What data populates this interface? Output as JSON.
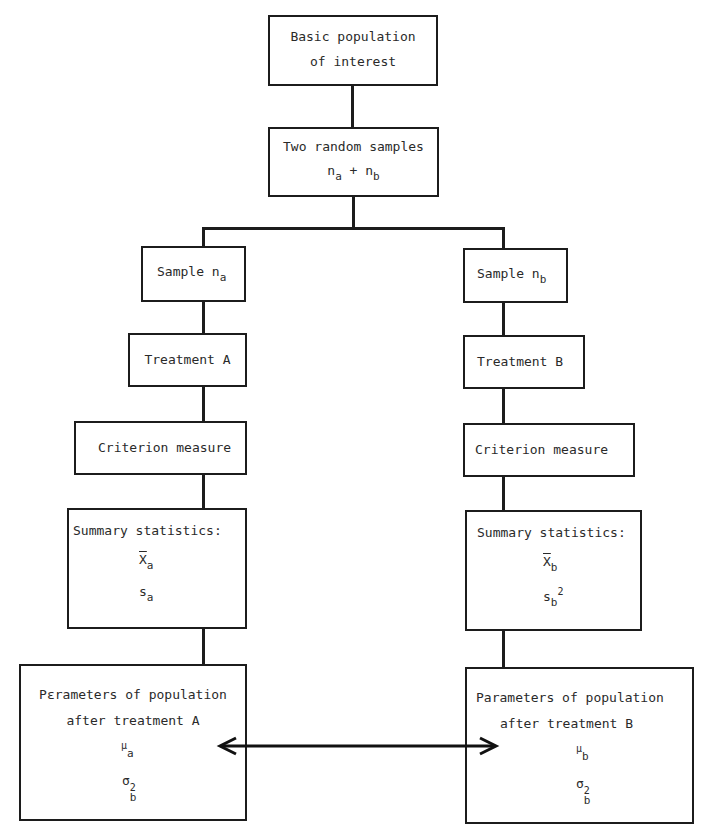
{
  "diagram": {
    "top": {
      "line1": "Basic population",
      "line2": "of interest"
    },
    "samples": {
      "line1": "Two random samples",
      "n_sym_a": "n",
      "n_sub_a": "a",
      "plus": "+",
      "n_sym_b": "n",
      "n_sub_b": "b"
    },
    "left": {
      "sample_label": "Sample n",
      "sample_sub": "a",
      "treatment": "Treatment A",
      "criterion": "Criterion measure",
      "summary_title": "Summary statistics:",
      "mean_sym": "X",
      "mean_sub": "a",
      "sd_sym": "s",
      "sd_sub": "a",
      "params_line1": "Pεrameters of population",
      "params_line2": "after treatment A",
      "mu_sym": "μ",
      "mu_sub": "a",
      "sigma_sym": "σ",
      "sigma_sub": "b",
      "sigma_sup": "2"
    },
    "right": {
      "sample_label": "Sample n",
      "sample_sub": "b",
      "treatment": "Treatment B",
      "criterion": "Criterion measure",
      "summary_title": "Summary statistics:",
      "mean_sym": "X",
      "mean_sub": "b",
      "sd_sym": "s",
      "sd_sub": "b",
      "sd_sup": "2",
      "params_line1": "Parameters of population",
      "params_line2": "after treatment B",
      "mu_sym": "μ",
      "mu_sub": "b",
      "sigma_sym": "σ",
      "sigma_sub": "b",
      "sigma_sup": "2"
    },
    "arrow": "double-headed-arrow"
  }
}
